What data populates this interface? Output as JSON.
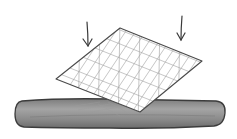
{
  "illustration": {
    "description": "Hand-drawn sketch: a mesh sheet being pressed down onto a rounded bar",
    "colors": {
      "background": "#ffffff",
      "outline": "#4a4a4a",
      "mesh": "#9a9a9a",
      "bar_fill": "#8e8e8e",
      "bar_highlight": "#a8a8a8",
      "bar_outline": "#3c3c3c"
    },
    "arrows": [
      {
        "name": "left-arrow",
        "x": 88,
        "y1": 22,
        "y2": 46
      },
      {
        "name": "right-arrow",
        "x": 181,
        "y1": 16,
        "y2": 40
      }
    ],
    "sheet": {
      "top": [
        120,
        28
      ],
      "right": [
        202,
        61
      ],
      "bottom": [
        140,
        112
      ],
      "left": [
        56,
        79
      ]
    },
    "bar": {
      "x": 15,
      "y": 99,
      "width": 210,
      "height": 29
    }
  }
}
